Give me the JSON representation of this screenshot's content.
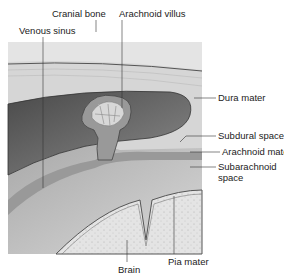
{
  "labels": {
    "cranial_bone": "Cranial bone",
    "arachnoid_villus": "Arachnoid villus",
    "venous_sinus": "Venous sinus",
    "dura_mater": "Dura mater",
    "subdural_space": "Subdural space",
    "arachnoid_mater": "Arachnoid mater",
    "subarachnoid_space_1": "Subarachnoid",
    "subarachnoid_space_2": "space",
    "brain": "Brain",
    "pia_mater": "Pia mater"
  },
  "colors": {
    "bone": "#e2e2e2",
    "dura": "#d4d4d4",
    "sinus": "#6a6a6a",
    "arachnoid": "#9a9a9a",
    "subarachnoid": "#c4c4c4",
    "brain": "#dcdcdc"
  }
}
